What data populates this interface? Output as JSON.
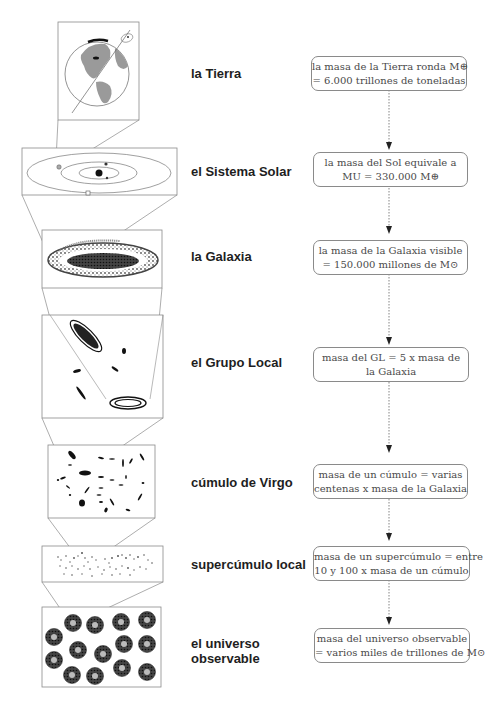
{
  "diagram": {
    "title": "",
    "levels": [
      {
        "id": "tierra",
        "label": "la Tierra",
        "mass_line1": "la masa de la Tierra ronda M⊕",
        "mass_line2": "= 6.000 trillones de toneladas",
        "illustration": "earth-globe-icon"
      },
      {
        "id": "sistema-solar",
        "label": "el Sistema Solar",
        "mass_line1": "la masa del Sol equivale a",
        "mass_line2": "MU = 330.000 M⊕",
        "illustration": "solar-system-orbits-icon"
      },
      {
        "id": "galaxia",
        "label": "la Galaxia",
        "mass_line1": "la masa de la Galaxia visible",
        "mass_line2": "= 150.000 millones de M⊙",
        "illustration": "spiral-galaxy-icon"
      },
      {
        "id": "grupo-local",
        "label": "el Grupo Local",
        "mass_line1": "masa del GL = 5 x masa de",
        "mass_line2": "la Galaxia",
        "illustration": "local-group-galaxies-icon"
      },
      {
        "id": "cumulo-virgo",
        "label": "cúmulo de Virgo",
        "mass_line1": "masa de un cúmulo = varias",
        "mass_line2": "centenas x masa de la Galaxia",
        "illustration": "galaxy-cluster-icon"
      },
      {
        "id": "supercumulo",
        "label": "supercúmulo local",
        "mass_line1": "masa de un supercúmulo = entre",
        "mass_line2": "10 y 100 x masa de un cúmulo",
        "illustration": "supercluster-dots-icon"
      },
      {
        "id": "universo",
        "label_line1": "el universo",
        "label_line2": "observable",
        "mass_line1": "masa del universo observable",
        "mass_line2": "= varios miles de trillones de M⊙",
        "illustration": "observable-universe-icon"
      }
    ],
    "connector": "dotted-arrow-down"
  },
  "colors": {
    "line": "#8a8a8a",
    "ink": "#1e1e1e",
    "gray_fill": "#9a9a9a"
  }
}
